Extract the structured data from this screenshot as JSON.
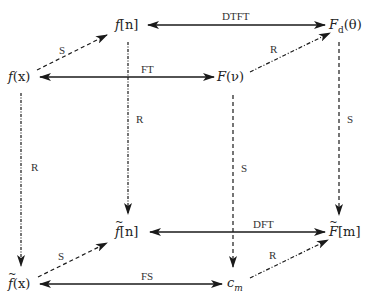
{
  "diagram": {
    "nodes": {
      "f_n": {
        "base": "f",
        "arg": "[n]",
        "text": "f[n]"
      },
      "Fd_theta": {
        "base": "F",
        "sub": "d",
        "arg": "(θ)",
        "text": "F_d(θ)"
      },
      "f_x": {
        "base": "f",
        "arg": "(x)",
        "text": "f(x)"
      },
      "F_nu": {
        "base": "F",
        "arg": "(ν)",
        "text": "F(ν)"
      },
      "ft_n": {
        "base": "f",
        "arg": "[n]",
        "text": "f̃[n]",
        "tilde": true
      },
      "Ft_m": {
        "base": "F",
        "arg": "[m]",
        "text": "F̃[m]",
        "tilde": true
      },
      "ft_x": {
        "base": "f",
        "arg": "(x)",
        "text": "f̃(x)",
        "tilde": true
      },
      "c_m": {
        "base": "c",
        "sub": "m",
        "text": "c_m"
      }
    },
    "edges": [
      {
        "from": "f_n",
        "to": "Fd_theta",
        "label": "DTFT",
        "style": "solid",
        "bidirectional": true
      },
      {
        "from": "f_x",
        "to": "F_nu",
        "label": "FT",
        "style": "solid",
        "bidirectional": true
      },
      {
        "from": "ft_n",
        "to": "Ft_m",
        "label": "DFT",
        "style": "solid",
        "bidirectional": true
      },
      {
        "from": "ft_x",
        "to": "c_m",
        "label": "FS",
        "style": "solid",
        "bidirectional": true
      },
      {
        "from": "f_x",
        "to": "f_n",
        "label": "S",
        "style": "dashed"
      },
      {
        "from": "F_nu",
        "to": "Fd_theta",
        "label": "R",
        "style": "dashdot"
      },
      {
        "from": "ft_x",
        "to": "ft_n",
        "label": "S",
        "style": "dashed"
      },
      {
        "from": "c_m",
        "to": "Ft_m",
        "label": "R",
        "style": "dashdot"
      },
      {
        "from": "f_x",
        "to": "ft_x",
        "label": "R",
        "style": "dashdot"
      },
      {
        "from": "f_n",
        "to": "ft_n",
        "label": "R",
        "style": "dashdot"
      },
      {
        "from": "F_nu",
        "to": "c_m",
        "label": "S",
        "style": "dashed"
      },
      {
        "from": "Fd_theta",
        "to": "Ft_m",
        "label": "S",
        "style": "dashed"
      }
    ],
    "labels": {
      "dtft": "DTFT",
      "ft": "FT",
      "dft": "DFT",
      "fs": "FS",
      "s_top_left": "S",
      "r_top_right": "R",
      "s_bottom_left": "S",
      "r_bottom_right": "R",
      "r_left_vertical": "R",
      "r_inner_vertical": "R",
      "s_inner_vertical": "S",
      "s_right_vertical": "S"
    },
    "colors": {
      "line": "#1a1a1a",
      "text": "#222222",
      "background": "#ffffff"
    }
  }
}
